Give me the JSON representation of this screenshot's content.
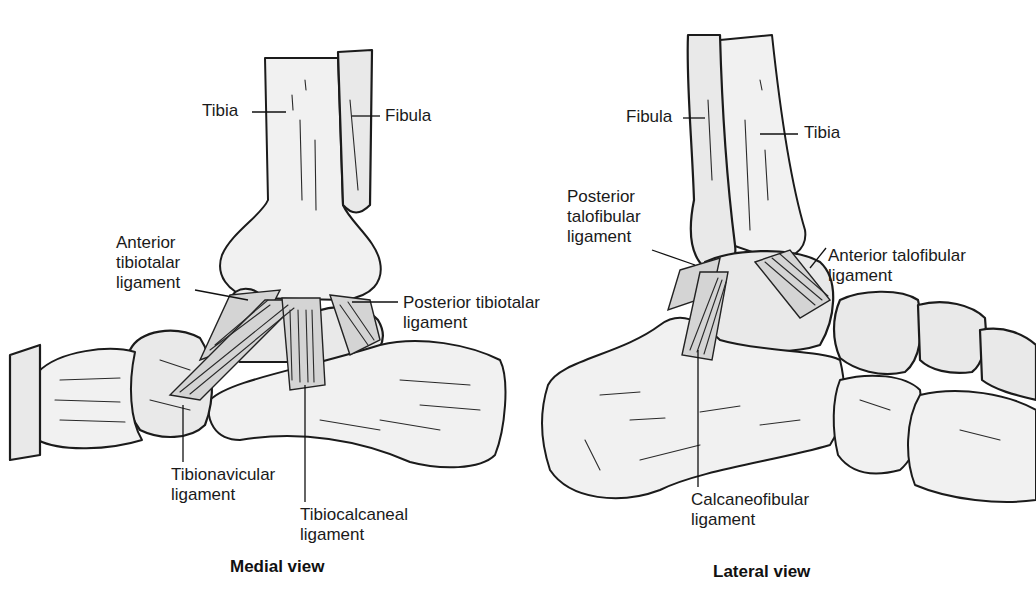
{
  "figure": {
    "panels": [
      {
        "caption": "Medial view",
        "labels": {
          "tibia": "Tibia",
          "fibula": "Fibula",
          "anterior_tibiotalar": [
            "Anterior",
            "tibiotalar",
            "ligament"
          ],
          "posterior_tibiotalar": [
            "Posterior tibiotalar",
            "ligament"
          ],
          "tibionavicular": [
            "Tibionavicular",
            "ligament"
          ],
          "tibiocalcaneal": [
            "Tibiocalcaneal",
            "ligament"
          ]
        }
      },
      {
        "caption": "Lateral view",
        "labels": {
          "fibula": "Fibula",
          "tibia": "Tibia",
          "posterior_talofibular": [
            "Posterior",
            "talofibular",
            "ligament"
          ],
          "anterior_talofibular": [
            "Anterior talofibular",
            "ligament"
          ],
          "calcaneofibular": [
            "Calcaneofibular",
            "ligament"
          ]
        }
      }
    ]
  }
}
